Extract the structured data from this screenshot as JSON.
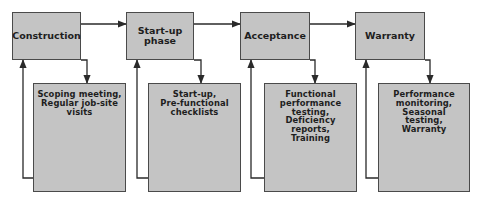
{
  "diagram": {
    "phases": [
      {
        "title_lines": [
          "Construction"
        ],
        "detail_lines": [
          "Scoping meeting,",
          "Regular job-site",
          "visits"
        ]
      },
      {
        "title_lines": [
          "Start-up",
          "phase"
        ],
        "detail_lines": [
          "Start-up,",
          "Pre-functional",
          "checklists"
        ]
      },
      {
        "title_lines": [
          "Acceptance"
        ],
        "detail_lines": [
          "Functional",
          "performance",
          "testing,",
          "Deficiency",
          "reports,",
          "Training"
        ]
      },
      {
        "title_lines": [
          "Warranty"
        ],
        "detail_lines": [
          "Performance",
          "monitoring,",
          "Seasonal",
          "testing,",
          "Warranty"
        ]
      }
    ],
    "colors": {
      "box_fill": "#c4c4c4",
      "box_border": "#4a4a4a",
      "line": "#2a2a2a",
      "text": "#1e1e1e"
    }
  }
}
